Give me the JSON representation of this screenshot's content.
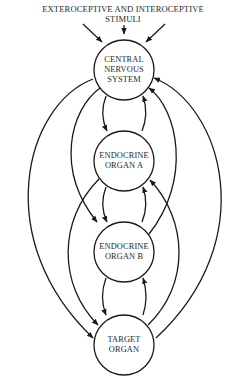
{
  "diagram": {
    "title_line1": "EXTEROCEPTIVE AND INTEROCEPTIVE",
    "title_line2": "STIMULI",
    "nodes": [
      {
        "id": "cns",
        "line1": "CENTRAL",
        "line2": "NERVOUS",
        "line3": "SYSTEM"
      },
      {
        "id": "organ-a",
        "line1": "ENDOCRINE",
        "line2": "ORGAN A"
      },
      {
        "id": "organ-b",
        "line1": "ENDOCRINE",
        "line2": "ORGAN B"
      },
      {
        "id": "target",
        "line1": "TARGET",
        "line2": "ORGAN"
      }
    ],
    "edges": [
      {
        "from": "stimuli",
        "to": "cns",
        "count": 3
      },
      {
        "from": "cns",
        "to": "organ-a"
      },
      {
        "from": "organ-a",
        "to": "cns"
      },
      {
        "from": "organ-a",
        "to": "organ-b"
      },
      {
        "from": "organ-b",
        "to": "organ-a"
      },
      {
        "from": "organ-b",
        "to": "target"
      },
      {
        "from": "target",
        "to": "organ-b"
      },
      {
        "from": "cns",
        "to": "organ-b"
      },
      {
        "from": "organ-b",
        "to": "cns"
      },
      {
        "from": "organ-a",
        "to": "target"
      },
      {
        "from": "target",
        "to": "organ-a"
      },
      {
        "from": "cns",
        "to": "target"
      },
      {
        "from": "target",
        "to": "cns"
      }
    ],
    "colors": {
      "stroke": "#1a1a1a",
      "text": "#2a2a2a",
      "background": "#ffffff"
    }
  }
}
